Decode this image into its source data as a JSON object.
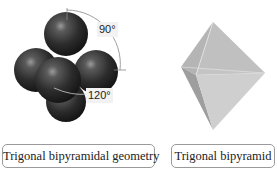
{
  "diagram": {
    "left_figure": {
      "name": "Ball-and-stick model (space-filling)",
      "angles": {
        "axial": "90°",
        "equatorial": "120°"
      },
      "caption": "Trigonal bipyramidal geometry"
    },
    "right_figure": {
      "name": "Polyhedron",
      "caption": "Trigonal bipyramid"
    },
    "colors": {
      "sphere": "#2b2b2b",
      "polyhedron_light": "#c8c8c8",
      "polyhedron_dark": "#9c9c9c",
      "caption_border": "#9a9a9a",
      "label_bg": "#f2f2f2"
    }
  }
}
